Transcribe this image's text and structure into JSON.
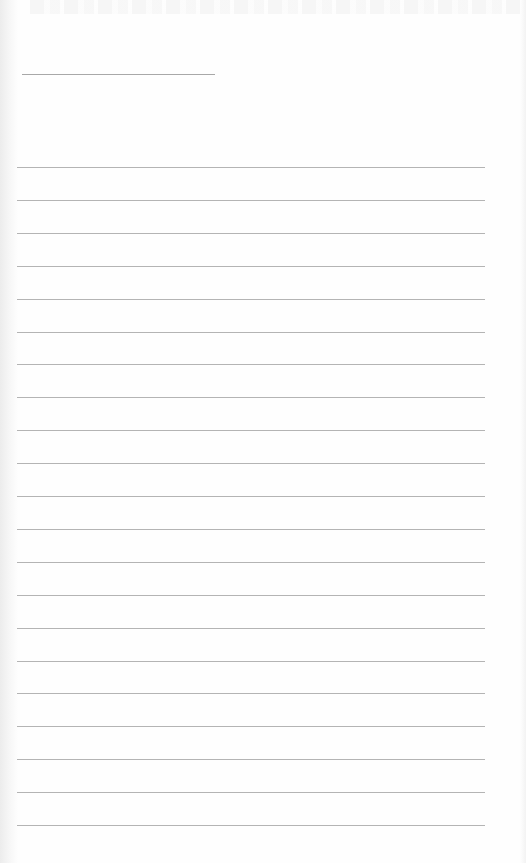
{
  "page": {
    "type": "blank lined notebook page",
    "background_color": "#fefefe",
    "line_color": "#b4b4b4"
  },
  "header_line": {
    "x": 22,
    "y": 74,
    "width": 193
  },
  "ruled_lines": {
    "count": 21,
    "start_y": 167,
    "spacing": 32.9,
    "x": 17,
    "width": 468
  }
}
